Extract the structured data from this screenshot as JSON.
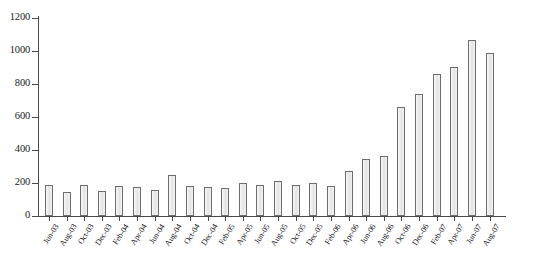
{
  "chart_data": {
    "type": "bar",
    "title": "",
    "subtitle": "",
    "xlabel": "",
    "ylabel": "",
    "ylim": [
      0,
      1200
    ],
    "yticks": [
      0,
      200,
      400,
      600,
      800,
      1000,
      1200
    ],
    "ytick_labels": [
      "0",
      "200",
      "400",
      "600",
      "800",
      "1000",
      "1200"
    ],
    "grid": false,
    "legend": false,
    "legend_position": "none",
    "bar_fill_color": "#ebebeb",
    "bar_edge_color": "#6e6e6e",
    "axis_color": "#4a4a4a",
    "categories": [
      "Jun-03",
      "Aug-03",
      "Oct-03",
      "Dec-03",
      "Feb-04",
      "Apr-04",
      "Jun-04",
      "Aug-04",
      "Oct-04",
      "Dec-04",
      "Feb-05",
      "Apr-05",
      "Jun-05",
      "Aug-05",
      "Oct-05",
      "Dec-05",
      "Feb-06",
      "Apr-06",
      "Jun-06",
      "Aug-06",
      "Oct-06",
      "Dec-06",
      "Feb-07",
      "Apr-07",
      "Jun-07",
      "Aug-07"
    ],
    "values": [
      190,
      148,
      188,
      152,
      180,
      178,
      155,
      250,
      180,
      178,
      172,
      200,
      185,
      215,
      188,
      200,
      180,
      275,
      348,
      365,
      658,
      740,
      862,
      905,
      1068,
      985
    ]
  }
}
